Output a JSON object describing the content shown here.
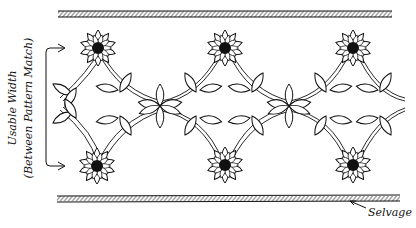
{
  "diagram": {
    "labels": {
      "usable_width_line1": "Usable Width",
      "usable_width_line2": "(Between Pattern Match)",
      "selvage": "Selvage"
    },
    "flowers": [
      {
        "id": "top-1",
        "x": 98,
        "y": 48
      },
      {
        "id": "top-2",
        "x": 225,
        "y": 48
      },
      {
        "id": "top-3",
        "x": 353,
        "y": 48
      },
      {
        "id": "bottom-1",
        "x": 97,
        "y": 166
      },
      {
        "id": "bottom-2",
        "x": 225,
        "y": 165
      },
      {
        "id": "bottom-3",
        "x": 353,
        "y": 165
      }
    ],
    "colors": {
      "ink": "#111111",
      "background": "#ffffff"
    }
  }
}
